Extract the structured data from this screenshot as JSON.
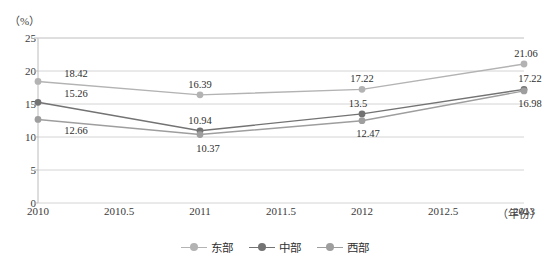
{
  "chart_data": {
    "type": "line",
    "title": "",
    "xlabel": "（年份）",
    "ylabel": "（%）",
    "x": [
      2010,
      2011,
      2012,
      2013
    ],
    "xticks": [
      "2010",
      "2010.5",
      "2011",
      "2011.5",
      "2012",
      "2012.5",
      "2013"
    ],
    "xtick_values": [
      2010,
      2010.5,
      2011,
      2011.5,
      2012,
      2012.5,
      2013
    ],
    "xlim": [
      2010,
      2013
    ],
    "yticks": [
      "0",
      "5",
      "10",
      "15",
      "20",
      "25"
    ],
    "ytick_values": [
      0,
      5,
      10,
      15,
      20,
      25
    ],
    "ylim": [
      0,
      25
    ],
    "grid": true,
    "legend_position": "bottom",
    "series": [
      {
        "name": "东部",
        "color": "#b3b3b3",
        "values": [
          18.42,
          16.39,
          17.22,
          21.06
        ],
        "labels": [
          "18.42",
          "16.39",
          "17.22",
          "21.06"
        ]
      },
      {
        "name": "中部",
        "color": "#737373",
        "values": [
          15.26,
          10.94,
          13.5,
          17.22
        ],
        "labels": [
          "15.26",
          "10.94",
          "13.5",
          "17.22"
        ]
      },
      {
        "name": "西部",
        "color": "#9e9e9e",
        "values": [
          12.66,
          10.37,
          12.47,
          16.98
        ],
        "labels": [
          "12.66",
          "10.37",
          "12.47",
          "16.98"
        ]
      }
    ],
    "annotations": [
      {
        "text": "18.42",
        "x": 2010,
        "y": 18.42,
        "dx": 38,
        "dy": -8
      },
      {
        "text": "15.26",
        "x": 2010,
        "y": 15.26,
        "dx": 38,
        "dy": -9
      },
      {
        "text": "12.66",
        "x": 2010,
        "y": 12.66,
        "dx": 38,
        "dy": 11
      },
      {
        "text": "16.39",
        "x": 2011,
        "y": 16.39,
        "dx": 0,
        "dy": -11
      },
      {
        "text": "10.94",
        "x": 2011,
        "y": 10.94,
        "dx": 0,
        "dy": -11
      },
      {
        "text": "10.37",
        "x": 2011,
        "y": 10.37,
        "dx": 8,
        "dy": 13
      },
      {
        "text": "17.22",
        "x": 2012,
        "y": 17.22,
        "dx": 0,
        "dy": -11
      },
      {
        "text": "13.5",
        "x": 2012,
        "y": 13.5,
        "dx": -4,
        "dy": -11
      },
      {
        "text": "12.47",
        "x": 2012,
        "y": 12.47,
        "dx": 6,
        "dy": 12
      },
      {
        "text": "21.06",
        "x": 2013,
        "y": 21.06,
        "dx": 2,
        "dy": -11
      },
      {
        "text": "17.22",
        "x": 2013,
        "y": 17.22,
        "dx": 6,
        "dy": -11
      },
      {
        "text": "16.98",
        "x": 2013,
        "y": 16.98,
        "dx": 6,
        "dy": 12
      }
    ]
  },
  "legend": {
    "items": [
      {
        "label": "东部"
      },
      {
        "label": "中部"
      },
      {
        "label": "西部"
      }
    ]
  },
  "colors": {
    "east": "#b3b3b3",
    "central": "#737373",
    "west": "#9e9e9e",
    "grid": "#d4d4d4",
    "axis": "#bcbcbc",
    "text": "#3a3a3a"
  }
}
